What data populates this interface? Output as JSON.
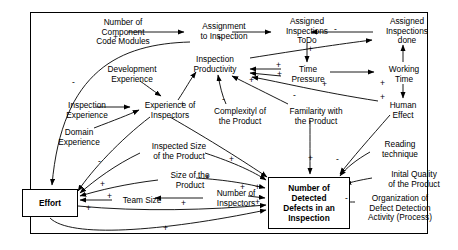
{
  "diagram": {
    "type": "causal-loop-diagram",
    "border_color": "#000000",
    "text_color": "#000000",
    "background": "#ffffff"
  },
  "nodes": [
    {
      "id": "code_modules",
      "label": "Number of\nComponent\nCode Modules",
      "x": 81,
      "y": 18,
      "w": 84,
      "style": "plain"
    },
    {
      "id": "assignment",
      "label": "Assignment\nto Inspection",
      "x": 188,
      "y": 22,
      "w": 72,
      "style": "plain"
    },
    {
      "id": "todo",
      "label": "Assigned\nInspections\nToDo",
      "x": 276,
      "y": 17,
      "w": 62,
      "style": "plain"
    },
    {
      "id": "done",
      "label": "Assigned\nInspections\ndone",
      "x": 376,
      "y": 17,
      "w": 62,
      "style": "plain"
    },
    {
      "id": "productivity",
      "label": "Inspection\nProductivity",
      "x": 182,
      "y": 55,
      "w": 66,
      "style": "plain"
    },
    {
      "id": "time_pressure",
      "label": "Time\nPressure",
      "x": 284,
      "y": 65,
      "w": 48,
      "style": "plain"
    },
    {
      "id": "working_time",
      "label": "Working\nTime",
      "x": 378,
      "y": 65,
      "w": 52,
      "style": "plain"
    },
    {
      "id": "dev_experience",
      "label": "Development\nExperience",
      "x": 94,
      "y": 65,
      "w": 76,
      "style": "plain"
    },
    {
      "id": "insp_experience",
      "label": "Inspection\nExperience",
      "x": 56,
      "y": 101,
      "w": 62,
      "style": "plain"
    },
    {
      "id": "exp_inspectors",
      "label": "Experience of\nInspectors",
      "x": 134,
      "y": 101,
      "w": 72,
      "style": "plain"
    },
    {
      "id": "domain_experience",
      "label": "Domain\nExperience",
      "x": 46,
      "y": 128,
      "w": 66,
      "style": "plain"
    },
    {
      "id": "complexity",
      "label": "Complexityl of\nthe Product",
      "x": 204,
      "y": 107,
      "w": 72,
      "style": "plain"
    },
    {
      "id": "familarity",
      "label": "Familarity with\nthe Product",
      "x": 280,
      "y": 107,
      "w": 72,
      "style": "plain"
    },
    {
      "id": "human_effect",
      "label": "Human\nEffect",
      "x": 380,
      "y": 101,
      "w": 46,
      "style": "plain"
    },
    {
      "id": "inspected_size",
      "label": "Inspected Size\nof the Product",
      "x": 138,
      "y": 142,
      "w": 82,
      "style": "plain"
    },
    {
      "id": "reading_technique",
      "label": "Reading\ntechnique",
      "x": 372,
      "y": 140,
      "w": 56,
      "style": "plain"
    },
    {
      "id": "size_product",
      "label": "Size of the\nProduct",
      "x": 159,
      "y": 171,
      "w": 62,
      "style": "plain"
    },
    {
      "id": "initial_quality",
      "label": "Inital Quality\nof the Product",
      "x": 376,
      "y": 170,
      "w": 76,
      "style": "plain"
    },
    {
      "id": "num_inspectors",
      "label": "Number of\nInspectors",
      "x": 205,
      "y": 189,
      "w": 62,
      "style": "plain"
    },
    {
      "id": "team_size",
      "label": "Team Size",
      "x": 114,
      "y": 196,
      "w": 56,
      "style": "plain"
    },
    {
      "id": "organization",
      "label": "Organization of\nDefect Detection\nActivity (Process)",
      "x": 358,
      "y": 194,
      "w": 84,
      "style": "plain"
    },
    {
      "id": "effort",
      "label": "Effort",
      "x": 22,
      "y": 189,
      "w": 56,
      "h": 28,
      "style": "box"
    },
    {
      "id": "defects",
      "label": "Number of\nDetected\nDefects in an\nInspection",
      "x": 268,
      "y": 177,
      "w": 82,
      "h": 52,
      "style": "box"
    }
  ],
  "signs": [
    {
      "sign": "+",
      "x": 113,
      "y": 33
    },
    {
      "sign": "+",
      "x": 217,
      "y": 34
    },
    {
      "sign": "-",
      "x": 334,
      "y": 25
    },
    {
      "sign": "+",
      "x": 308,
      "y": 45
    },
    {
      "sign": "+",
      "x": 276,
      "y": 61
    },
    {
      "sign": "+",
      "x": 277,
      "y": 70
    },
    {
      "sign": "+",
      "x": 249,
      "y": 76
    },
    {
      "sign": "+",
      "x": 322,
      "y": 80
    },
    {
      "sign": "+",
      "x": 380,
      "y": 79
    },
    {
      "sign": "+",
      "x": 380,
      "y": 93
    },
    {
      "sign": "-",
      "x": 72,
      "y": 78
    },
    {
      "sign": "+",
      "x": 180,
      "y": 100
    },
    {
      "sign": "-",
      "x": 222,
      "y": 95
    },
    {
      "sign": "-",
      "x": 293,
      "y": 91
    },
    {
      "sign": "-",
      "x": 98,
      "y": 157
    },
    {
      "sign": "+",
      "x": 229,
      "y": 155
    },
    {
      "sign": "+",
      "x": 308,
      "y": 154
    },
    {
      "sign": "-",
      "x": 336,
      "y": 155
    },
    {
      "sign": "+",
      "x": 100,
      "y": 180
    },
    {
      "sign": "+",
      "x": 205,
      "y": 173
    },
    {
      "sign": "+",
      "x": 107,
      "y": 192
    },
    {
      "sign": "+",
      "x": 240,
      "y": 183
    },
    {
      "sign": "+",
      "x": 255,
      "y": 183
    },
    {
      "sign": "+",
      "x": 86,
      "y": 204
    },
    {
      "sign": "+",
      "x": 181,
      "y": 199
    },
    {
      "sign": "+",
      "x": 255,
      "y": 198
    },
    {
      "sign": "-",
      "x": 345,
      "y": 194
    },
    {
      "sign": "+",
      "x": 163,
      "y": 224
    }
  ],
  "edges": [
    {
      "from": "code_modules",
      "to": "assignment",
      "polarity": "+"
    },
    {
      "from": "assignment",
      "to": "todo",
      "polarity": "+"
    },
    {
      "from": "done",
      "to": "todo",
      "polarity": "-"
    },
    {
      "from": "todo",
      "to": "time_pressure",
      "polarity": "+"
    },
    {
      "from": "time_pressure",
      "to": "productivity",
      "polarity": "+"
    },
    {
      "from": "time_pressure",
      "to": "working_time",
      "polarity": "+"
    },
    {
      "from": "working_time",
      "to": "done",
      "polarity": "+"
    },
    {
      "from": "working_time",
      "to": "human_effect",
      "polarity": "+"
    },
    {
      "from": "human_effect",
      "to": "productivity",
      "polarity": "-"
    },
    {
      "from": "productivity",
      "to": "done",
      "polarity": "+"
    },
    {
      "from": "assignment",
      "to": "effort",
      "polarity": "-"
    },
    {
      "from": "dev_experience",
      "to": "exp_inspectors",
      "polarity": "+"
    },
    {
      "from": "insp_experience",
      "to": "exp_inspectors",
      "polarity": "+"
    },
    {
      "from": "domain_experience",
      "to": "exp_inspectors",
      "polarity": "+"
    },
    {
      "from": "exp_inspectors",
      "to": "productivity",
      "polarity": "+"
    },
    {
      "from": "exp_inspectors",
      "to": "defects",
      "polarity": "+"
    },
    {
      "from": "exp_inspectors",
      "to": "effort",
      "polarity": "-"
    },
    {
      "from": "complexity",
      "to": "productivity",
      "polarity": "-"
    },
    {
      "from": "familarity",
      "to": "productivity",
      "polarity": "-"
    },
    {
      "from": "familarity",
      "to": "defects",
      "polarity": "+"
    },
    {
      "from": "inspected_size",
      "to": "defects",
      "polarity": "+"
    },
    {
      "from": "inspected_size",
      "to": "effort",
      "polarity": "+"
    },
    {
      "from": "size_product",
      "to": "defects",
      "polarity": "+"
    },
    {
      "from": "size_product",
      "to": "effort",
      "polarity": "+"
    },
    {
      "from": "num_inspectors",
      "to": "team_size",
      "polarity": "+"
    },
    {
      "from": "num_inspectors",
      "to": "defects",
      "polarity": "+"
    },
    {
      "from": "team_size",
      "to": "effort",
      "polarity": "+"
    },
    {
      "from": "reading_technique",
      "to": "defects",
      "polarity": "+"
    },
    {
      "from": "initial_quality",
      "to": "defects",
      "polarity": "-"
    },
    {
      "from": "organization",
      "to": "defects",
      "polarity": "+"
    },
    {
      "from": "human_effect",
      "to": "defects",
      "polarity": "-"
    },
    {
      "from": "effort",
      "to": "defects",
      "polarity": "+"
    }
  ]
}
